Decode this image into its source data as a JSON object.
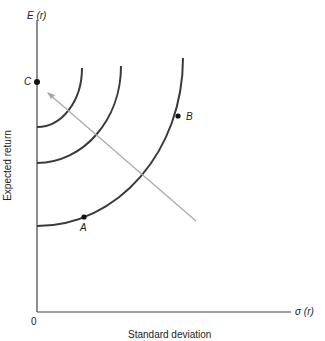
{
  "figure": {
    "y_axis_symbol": "E (r)",
    "x_axis_symbol": "σ (r)",
    "y_axis_label": "Expected return",
    "x_axis_label": "Standard deviation",
    "origin_label": "0",
    "points": [
      {
        "label": "C",
        "description": "on vertical axis"
      },
      {
        "label": "A",
        "description": "on outer indifference curve, low risk"
      },
      {
        "label": "B",
        "description": "on outer indifference curve, high risk"
      }
    ],
    "curves": [
      "inner indifference curve",
      "middle indifference curve",
      "outer indifference curve"
    ],
    "arrow": "direction of increasing utility (toward upper-left)",
    "colors": {
      "curve": "#3a3a3a",
      "axis": "#444444",
      "arrow": "#a8a8a8"
    }
  }
}
